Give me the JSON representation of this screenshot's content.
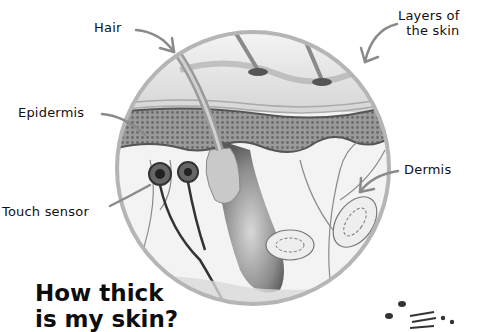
{
  "diagram": {
    "labels": {
      "hair": "Hair",
      "layers": "Layers of",
      "layers_line2": "the skin",
      "epidermis": "Epidermis",
      "dermis": "Dermis",
      "touch_sensor": "Touch sensor"
    },
    "title": {
      "line1": "How thick",
      "line2": "is my skin?"
    },
    "colors": {
      "background": "#ffffff",
      "text": "#111111",
      "arrow": "#8a8a8a",
      "circle_border": "#b5b5b5",
      "epidermis": "#7a7a7a",
      "dermis": "#f2f2f2"
    }
  }
}
